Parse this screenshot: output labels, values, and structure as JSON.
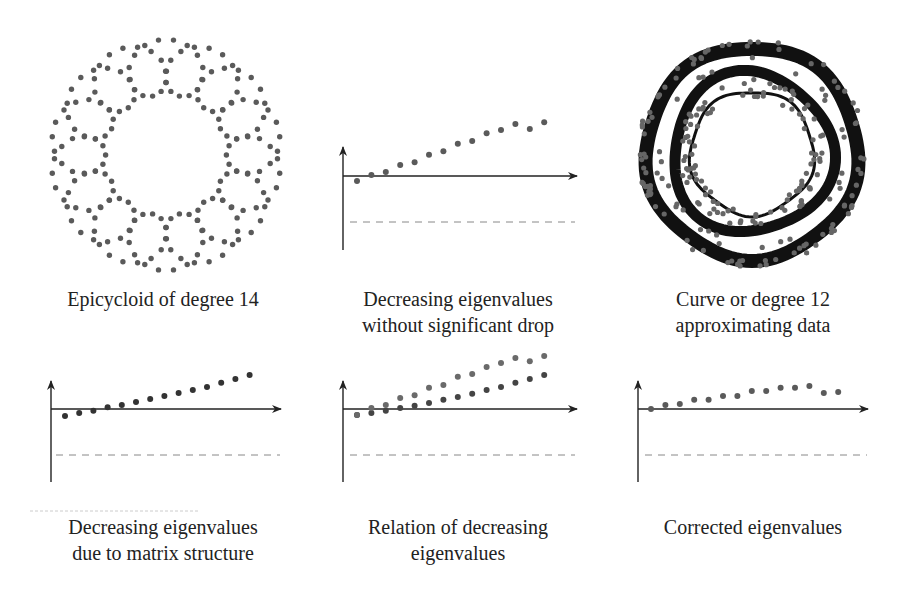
{
  "figure": {
    "panels": [
      {
        "id": "epicycloid",
        "caption": [
          "Epicycloid of degree 14"
        ]
      },
      {
        "id": "no-drop",
        "caption": [
          "Decreasing eigenvalues",
          "without significant drop"
        ]
      },
      {
        "id": "curve12",
        "caption": [
          "Curve or degree 12",
          "approximating data"
        ]
      },
      {
        "id": "matrix-structure",
        "caption": [
          "Decreasing eigenvalues",
          "due to matrix structure"
        ]
      },
      {
        "id": "relation",
        "caption": [
          "Relation of decreasing",
          "eigenvalues"
        ]
      },
      {
        "id": "corrected",
        "caption": [
          "Corrected eigenvalues"
        ]
      }
    ]
  },
  "colors": {
    "dot": "#5a5a5a",
    "axis": "#222222",
    "dash": "#777777",
    "ring": "#111111"
  },
  "chart_data": [
    {
      "type": "scatter",
      "title": "Epicycloid of degree 14",
      "description": "Dotted epicycloid-like curve with 14 outer loops around a circular center",
      "loops": 14
    },
    {
      "type": "scatter",
      "title": "Decreasing eigenvalues without significant drop",
      "x": [
        1,
        2,
        3,
        4,
        5,
        6,
        7,
        8,
        9,
        10,
        11,
        12,
        13,
        14
      ],
      "values": [
        0.11,
        -0.02,
        -0.09,
        -0.24,
        -0.3,
        -0.46,
        -0.54,
        -0.7,
        -0.76,
        -0.93,
        -1.0,
        -1.13,
        -1.02,
        -1.17
      ],
      "reference_line": -1.0,
      "xlabel": "",
      "ylabel": "",
      "grid": false
    },
    {
      "type": "scatter",
      "title": "Curve or degree 12 approximating data",
      "description": "Noisy dotted data on concentric rings overlaid with a thick dark fitted curve of degree 12",
      "rings": 3
    },
    {
      "type": "scatter",
      "title": "Decreasing eigenvalues due to matrix structure",
      "x": [
        1,
        2,
        3,
        4,
        5,
        6,
        7,
        8,
        9,
        10,
        11,
        12,
        13,
        14
      ],
      "values": [
        0.15,
        0.09,
        0.04,
        -0.04,
        -0.09,
        -0.15,
        -0.22,
        -0.28,
        -0.35,
        -0.41,
        -0.48,
        -0.57,
        -0.65,
        -0.74
      ],
      "reference_line": -1.0,
      "xlabel": "",
      "ylabel": "",
      "grid": false
    },
    {
      "type": "scatter",
      "title": "Relation of decreasing eigenvalues",
      "x": [
        1,
        2,
        3,
        4,
        5,
        6,
        7,
        8,
        9,
        10,
        11,
        12,
        13,
        14
      ],
      "series": [
        {
          "name": "structure",
          "values": [
            0.13,
            0.09,
            0.04,
            -0.02,
            -0.07,
            -0.13,
            -0.2,
            -0.26,
            -0.33,
            -0.41,
            -0.48,
            -0.57,
            -0.65,
            -0.74
          ]
        },
        {
          "name": "observed",
          "values": [
            0.13,
            -0.02,
            -0.09,
            -0.24,
            -0.3,
            -0.46,
            -0.52,
            -0.7,
            -0.76,
            -0.91,
            -1.0,
            -1.11,
            -1.04,
            -1.15
          ]
        }
      ],
      "reference_line": -1.0,
      "xlabel": "",
      "ylabel": "",
      "grid": false
    },
    {
      "type": "scatter",
      "title": "Corrected eigenvalues",
      "x": [
        1,
        2,
        3,
        4,
        5,
        6,
        7,
        8,
        9,
        10,
        11,
        12,
        13,
        14
      ],
      "values": [
        0.0,
        -0.09,
        -0.11,
        -0.2,
        -0.2,
        -0.28,
        -0.28,
        -0.39,
        -0.39,
        -0.46,
        -0.46,
        -0.5,
        -0.35,
        -0.37
      ],
      "reference_line": -1.0,
      "xlabel": "",
      "ylabel": "",
      "grid": false
    }
  ]
}
